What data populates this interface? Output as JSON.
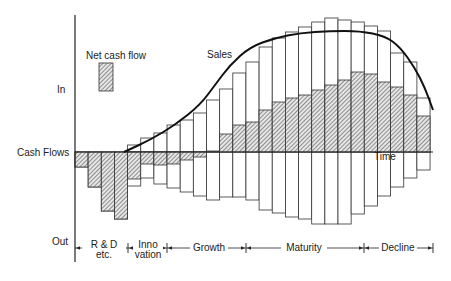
{
  "chart_data": {
    "type": "bar",
    "title": "",
    "xlabel": "Time",
    "ylabel": "Cash Flows",
    "y_axis_labels": {
      "top": "In",
      "middle": "Cash Flows",
      "bottom": "Out"
    },
    "legend": [
      {
        "label": "Net cash flow",
        "style": "hatched"
      }
    ],
    "annotations": [
      "Sales",
      "Time"
    ],
    "curve_label": "Sales",
    "phases": [
      {
        "label": "R & D etc.",
        "bars": 4
      },
      {
        "label": "Inno vation",
        "bars": 3
      },
      {
        "label": "Growth",
        "bars": 6
      },
      {
        "label": "Maturity",
        "bars": 9
      },
      {
        "label": "Decline",
        "bars": 5
      }
    ],
    "units": "relative (arbitrary)",
    "series": [
      {
        "name": "Inflow (sales revenue)",
        "values": [
          0,
          0,
          0,
          0,
          7,
          14,
          19,
          27,
          32,
          39,
          52,
          63,
          79,
          90,
          105,
          114,
          120,
          125,
          130,
          134,
          132,
          130,
          126,
          121,
          99,
          90,
          54
        ]
      },
      {
        "name": "Outflow (costs)",
        "values": [
          -15,
          -35,
          -59,
          -67,
          -34,
          -26,
          -32,
          -36,
          -40,
          -44,
          -48,
          -45,
          -45,
          -48,
          -58,
          -61,
          -65,
          -67,
          -72,
          -72,
          -72,
          -62,
          -54,
          -44,
          -35,
          -26,
          -18
        ]
      },
      {
        "name": "Net cash flow",
        "values": [
          -15,
          -35,
          -59,
          -67,
          -27,
          -12,
          -13,
          -12,
          -8,
          -5,
          1,
          18,
          27,
          30,
          42,
          50,
          54,
          57,
          62,
          67,
          72,
          80,
          78,
          70,
          65,
          57,
          36
        ]
      }
    ],
    "sales_curve": [
      [
        124,
        152
      ],
      [
        150,
        140
      ],
      [
        175,
        125
      ],
      [
        200,
        105
      ],
      [
        215,
        85
      ],
      [
        230,
        65
      ],
      [
        250,
        47
      ],
      [
        275,
        38
      ],
      [
        300,
        33
      ],
      [
        330,
        31
      ],
      [
        360,
        31
      ],
      [
        385,
        36
      ],
      [
        400,
        47
      ],
      [
        415,
        68
      ],
      [
        425,
        88
      ],
      [
        433,
        110
      ]
    ]
  },
  "labels": {
    "net_cash_flow": "Net cash flow",
    "sales": "Sales",
    "in": "In",
    "cash_flows": "Cash Flows",
    "out": "Out",
    "time": "Time",
    "rd_line1": "R & D",
    "rd_line2": "etc.",
    "inno_line1": "Inno",
    "inno_line2": "vation",
    "growth": "Growth",
    "maturity": "Maturity",
    "decline": "Decline"
  }
}
